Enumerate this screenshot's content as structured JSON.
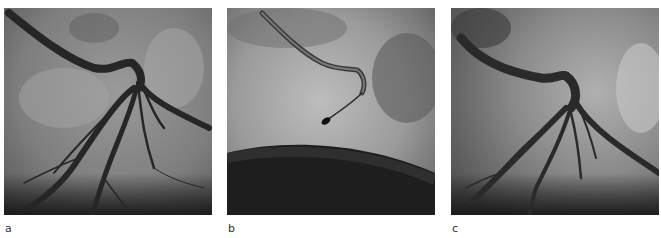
{
  "figure": {
    "panels": [
      {
        "label": "a",
        "description": "Coronary angiogram showing vessel tree with contrast filling"
      },
      {
        "label": "b",
        "description": "Angiogram with guidewire/catheter tip, vessels not opacified"
      },
      {
        "label": "c",
        "description": "Coronary angiogram showing restored vessel tree with contrast filling"
      }
    ]
  }
}
